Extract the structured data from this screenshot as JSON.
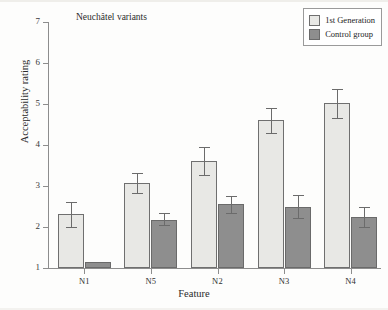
{
  "chart_data": {
    "type": "bar",
    "title": "Neuchâtel variants",
    "xlabel": "Feature",
    "ylabel": "Acceptability rating",
    "categories": [
      "N1",
      "N5",
      "N2",
      "N3",
      "N4"
    ],
    "ylim": [
      1,
      7
    ],
    "yticks": [
      1,
      2,
      3,
      4,
      5,
      6,
      7
    ],
    "grid": false,
    "legend_position": "top-right",
    "series": [
      {
        "name": "1st Generation",
        "color": "#e8e8e5",
        "values": [
          2.32,
          3.07,
          3.62,
          4.6,
          5.02
        ],
        "err_low": [
          2.0,
          2.82,
          3.28,
          4.3,
          4.66
        ],
        "err_high": [
          2.62,
          3.32,
          3.96,
          4.9,
          5.36
        ]
      },
      {
        "name": "Control group",
        "color": "#8e8e8e",
        "values": [
          1.15,
          2.18,
          2.55,
          2.5,
          2.25
        ],
        "err_low": [
          1.15,
          2.05,
          2.35,
          2.23,
          2.0
        ],
        "err_high": [
          1.15,
          2.33,
          2.75,
          2.78,
          2.5
        ]
      }
    ]
  },
  "legend": {
    "items": [
      {
        "label": "1st Generation",
        "swatch": "gen1"
      },
      {
        "label": "Control group",
        "swatch": "control"
      }
    ]
  },
  "axes": {
    "y_tick_labels": [
      "7",
      "6",
      "5",
      "4",
      "3",
      "2",
      "1"
    ],
    "x_tick_labels": [
      "N1",
      "N5",
      "N2",
      "N3",
      "N4"
    ]
  }
}
